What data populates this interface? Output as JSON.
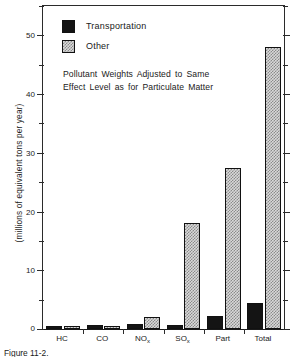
{
  "chart_data": {
    "type": "bar",
    "title": "",
    "subtitle": "",
    "xlabel": "",
    "ylabel": "(millions of equivalent tons per year)",
    "categories": [
      "HC",
      "CO",
      "NOx",
      "SOx",
      "Part",
      "Total"
    ],
    "category_labels": [
      {
        "base": "HC",
        "sub": ""
      },
      {
        "base": "CO",
        "sub": ""
      },
      {
        "base": "NO",
        "sub": "x"
      },
      {
        "base": "SO",
        "sub": "x"
      },
      {
        "base": "Part",
        "sub": ""
      },
      {
        "base": "Total",
        "sub": ""
      }
    ],
    "series": [
      {
        "name": "Transportation",
        "color": "#141414",
        "values": [
          0.5,
          0.6,
          0.8,
          0.6,
          2.3,
          4.5
        ]
      },
      {
        "name": "Other",
        "color": "#d9d9d9",
        "values": [
          0.2,
          0.2,
          2.1,
          18.0,
          27.5,
          48.0
        ]
      }
    ],
    "ylim": [
      0,
      55
    ],
    "yticks_major": [
      0,
      10,
      20,
      30,
      40,
      50
    ],
    "yticks_major_labels": [
      "0",
      "10",
      "20",
      "30",
      "40",
      "50"
    ],
    "yticks_minor": [
      5,
      15,
      25,
      35,
      45,
      55
    ],
    "grid": false,
    "legend_position": "top-left",
    "annotation": {
      "line1": "Pollutant Weights Adjusted to Same",
      "line2": "Effect Level as for Particulate Matter"
    }
  },
  "legend": {
    "items": [
      {
        "label": "Transportation",
        "swatch": "transportation"
      },
      {
        "label": "Other",
        "swatch": "other"
      }
    ]
  },
  "caption": {
    "text": "Figure 11-2."
  }
}
